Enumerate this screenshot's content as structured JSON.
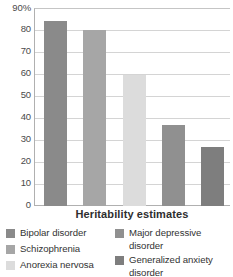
{
  "chart_data": {
    "type": "bar",
    "title": "",
    "subtitle": "",
    "xlabel": "Heritability estimates",
    "ylabel": "",
    "categories": [
      "Bipolar disorder",
      "Schizophrenia",
      "Anorexia nervosa",
      "Major depressive disorder",
      "Generalized anxiety disorder"
    ],
    "values": [
      85,
      81,
      60,
      37,
      27
    ],
    "ylim": [
      0,
      90
    ],
    "y_tick_labels": [
      "90%",
      "80",
      "70",
      "60",
      "50",
      "40",
      "30",
      "20",
      "10",
      "0"
    ],
    "y_tick_values": [
      90,
      80,
      70,
      60,
      50,
      40,
      30,
      20,
      10,
      0
    ],
    "grid": true,
    "legend_position": "bottom",
    "bar_colors": [
      "#8a8a8a",
      "#a6a6a6",
      "#dcdcdc",
      "#909090",
      "#7e7e7e"
    ]
  },
  "axis": {
    "y_labels": [
      {
        "text": "90%",
        "value": 90
      },
      {
        "text": "80",
        "value": 80
      },
      {
        "text": "70",
        "value": 70
      },
      {
        "text": "60",
        "value": 60
      },
      {
        "text": "50",
        "value": 50
      },
      {
        "text": "40",
        "value": 40
      },
      {
        "text": "30",
        "value": 30
      },
      {
        "text": "20",
        "value": 20
      },
      {
        "text": "10",
        "value": 10
      },
      {
        "text": "0",
        "value": 0
      }
    ],
    "x_title": "Heritability estimates"
  },
  "legend": {
    "left_column": [
      {
        "label": "Bipolar disorder",
        "color": "#8a8a8a"
      },
      {
        "label": "Schizophrenia",
        "color": "#a6a6a6"
      },
      {
        "label": "Anorexia nervosa",
        "color": "#dcdcdc"
      }
    ],
    "right_column": [
      {
        "label": "Major depressive disorder",
        "color": "#909090"
      },
      {
        "label": "Generalized anxiety disorder",
        "color": "#7e7e7e"
      }
    ]
  }
}
